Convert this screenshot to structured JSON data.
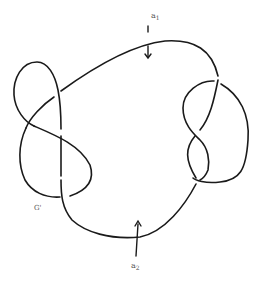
{
  "figure": {
    "type": "knot diagram",
    "labels": {
      "a1": {
        "base": "a",
        "sub": "1"
      },
      "a2": {
        "base": "a",
        "sub": "2"
      },
      "g_prime": "G'"
    },
    "arrows": [
      {
        "name": "a1-arrow",
        "direction": "down",
        "target": "top arc"
      },
      {
        "name": "a2-arrow",
        "direction": "up",
        "target": "bottom arc"
      }
    ],
    "colors": {
      "stroke": "#1a1a1a",
      "label": "#555555",
      "background": "#ffffff"
    }
  }
}
